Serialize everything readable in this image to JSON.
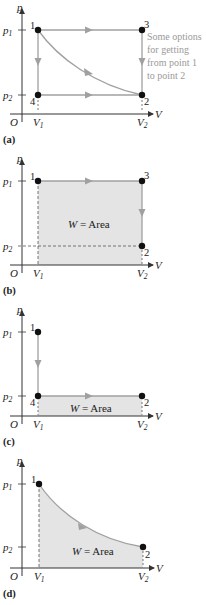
{
  "figure": {
    "colors": {
      "axis": "#333333",
      "path": "#a0a0a0",
      "arrow": "#a0a0a0",
      "shade": "#e4e4e4",
      "dash": "#555555",
      "point": "#111111",
      "note": "#9a9a9a"
    },
    "axes": {
      "y_label": "p",
      "x_label": "V",
      "origin": "O",
      "p1": "p",
      "p1_sub": "1",
      "p2": "p",
      "p2_sub": "2",
      "v1": "V",
      "v1_sub": "1",
      "v2": "V",
      "v2_sub": "2"
    },
    "panels": [
      {
        "id": "a",
        "caption": "(a)",
        "points": [
          "1",
          "3",
          "4",
          "2"
        ],
        "annotation": [
          "Some options",
          "for getting",
          "from point 1",
          "to point 2"
        ],
        "paths": [
          "1→3→2",
          "1→4→2",
          "1→2 (curve)"
        ]
      },
      {
        "id": "b",
        "caption": "(b)",
        "points": [
          "1",
          "3",
          "2"
        ],
        "area_label": "W = Area",
        "area_var": "W",
        "area_rest": " = Area",
        "paths": [
          "1→3→2"
        ]
      },
      {
        "id": "c",
        "caption": "(c)",
        "points": [
          "1",
          "4",
          "2"
        ],
        "area_label": "W = Area",
        "area_var": "W",
        "area_rest": " = Area",
        "paths": [
          "1→4→2"
        ]
      },
      {
        "id": "d",
        "caption": "(d)",
        "points": [
          "1",
          "2"
        ],
        "area_label": "W = Area",
        "area_var": "W",
        "area_rest": " = Area",
        "paths": [
          "1→2 (curve)"
        ]
      }
    ]
  }
}
